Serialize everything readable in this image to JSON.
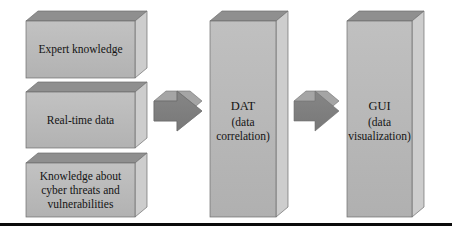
{
  "figure": {
    "background_color": "#ffffff",
    "box_face_color": "#b9b9b9",
    "box_top_color": "#8f8f8f",
    "box_side_color": "#cfcfcf",
    "arrow_face_color": "#7f7f7f",
    "arrow_top_color": "#a9a9a9",
    "outline_color": "#6e6e6e",
    "text_color": "#141414",
    "rule_color": "#0b0b0b"
  },
  "nodes": {
    "sources": [
      {
        "id": "expert-knowledge",
        "lines": [
          "Expert knowledge"
        ]
      },
      {
        "id": "real-time-data",
        "lines": [
          "Real-time data"
        ]
      },
      {
        "id": "cyber-threat-knowledge",
        "lines": [
          "Knowledge about",
          "cyber threats and",
          "vulnerabilities"
        ]
      }
    ],
    "columns": [
      {
        "id": "dat",
        "lines": [
          "DAT",
          "(data",
          "correlation)"
        ]
      },
      {
        "id": "gui",
        "lines": [
          "GUI",
          "(data",
          "visualization)"
        ]
      }
    ]
  },
  "connectors": [
    {
      "id": "arrow-sources-to-dat",
      "direction": "right",
      "from": "real-time-data",
      "to": "dat"
    },
    {
      "id": "arrow-dat-to-gui",
      "direction": "right",
      "from": "dat",
      "to": "gui"
    }
  ]
}
